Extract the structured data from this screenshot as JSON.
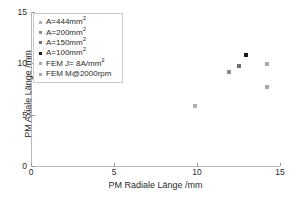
{
  "chart_data": {
    "type": "scatter",
    "title": "",
    "xlabel": "PM Radiale Länge /mm",
    "ylabel": "PM Axiale Länge /mm",
    "xlim": [
      0,
      15
    ],
    "ylim": [
      0,
      15
    ],
    "xticks": [
      0,
      5,
      10,
      15
    ],
    "yticks": [
      0,
      5,
      10,
      15
    ],
    "xticklabels": [
      "0",
      "5",
      "10",
      "15"
    ],
    "yticklabels": [
      "0",
      "5",
      "10",
      "15"
    ],
    "grid": false,
    "legend_position": "upper-left",
    "legend_entries": [
      {
        "label": "A=444mm²",
        "color": "#b0b0b0",
        "marker": "square"
      },
      {
        "label": "A=200mm²",
        "color": "#8c8c8c",
        "marker": "square"
      },
      {
        "label": "A=150mm²",
        "color": "#6e6e6e",
        "marker": "square"
      },
      {
        "label": "A=100mm²",
        "color": "#1a1a1a",
        "marker": "square"
      },
      {
        "label": "FEM J= 8A/mm²",
        "color": "#a8a8a8",
        "marker": "square"
      },
      {
        "label": "FEM M@2000rpm",
        "color": "#a8a8a8",
        "marker": "square"
      }
    ],
    "series": [
      {
        "name": "A=444mm²",
        "color": "#b0b0b0",
        "points": [
          {
            "x": 9.86,
            "y": 5.84
          }
        ]
      },
      {
        "name": "A=200mm²",
        "color": "#8c8c8c",
        "points": [
          {
            "x": 11.92,
            "y": 9.15
          }
        ]
      },
      {
        "name": "A=150mm²",
        "color": "#6e6e6e",
        "points": [
          {
            "x": 12.52,
            "y": 9.74
          }
        ]
      },
      {
        "name": "A=100mm²",
        "color": "#1a1a1a",
        "points": [
          {
            "x": 12.95,
            "y": 10.81
          }
        ]
      },
      {
        "name": "FEM J= 8A/mm²",
        "color": "#a8a8a8",
        "points": [
          {
            "x": 14.2,
            "y": 9.93
          }
        ]
      },
      {
        "name": "FEM M@2000rpm",
        "color": "#a8a8a8",
        "points": [
          {
            "x": 14.2,
            "y": 7.69
          }
        ]
      }
    ]
  }
}
